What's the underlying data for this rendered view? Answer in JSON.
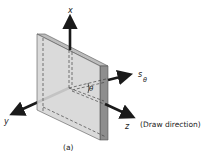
{
  "figure": {
    "caption": "(a)",
    "axes": {
      "x": "x",
      "y": "y",
      "z": "z",
      "s_theta_main": "s",
      "s_theta_sub": "θ",
      "angle": "θ"
    },
    "annotation": "(Draw direction)"
  },
  "colors": {
    "plate_face": "#d6d6d6",
    "plate_edge": "#8e8e8e",
    "plate_top": "#bdbdbd",
    "arrow": "#1a1a1a",
    "text": "#222222",
    "background": "#ffffff"
  }
}
